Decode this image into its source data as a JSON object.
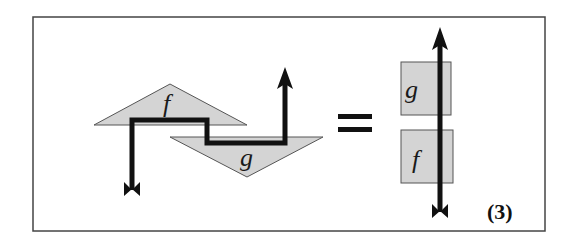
{
  "diagram": {
    "equation_number": "(3)",
    "left_side": {
      "boxes": [
        {
          "label": "f",
          "shape": "triangle-up"
        },
        {
          "label": "g",
          "shape": "triangle-down"
        }
      ]
    },
    "operator": "=",
    "right_side": {
      "boxes": [
        {
          "label": "g",
          "position": "top"
        },
        {
          "label": "f",
          "position": "bottom"
        }
      ]
    },
    "colors": {
      "box_fill": "#d4d4d4",
      "box_stroke": "#555555",
      "wire": "#111111",
      "frame": "#444444"
    }
  }
}
